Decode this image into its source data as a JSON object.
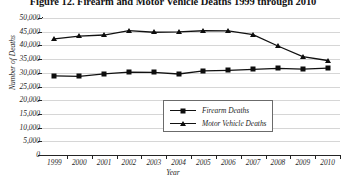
{
  "chart_data": {
    "type": "line",
    "title": "Figure 12. Firearm and Motor Vehicle Deaths 1999 through 2010",
    "xlabel": "Year",
    "ylabel": "Number of Deaths",
    "categories": [
      "1999",
      "2000",
      "2001",
      "2002",
      "2003",
      "2004",
      "2005",
      "2006",
      "2007",
      "2008",
      "2009",
      "2010"
    ],
    "ylim": [
      0,
      50000
    ],
    "ytick_labels": [
      "50,000",
      "45,000",
      "40,000",
      "35,000",
      "30,000",
      "25,000",
      "20,000",
      "15,000",
      "10,000",
      "5,000",
      "0"
    ],
    "ytick_values": [
      50000,
      45000,
      40000,
      35000,
      30000,
      25000,
      20000,
      15000,
      10000,
      5000,
      0
    ],
    "grid": true,
    "legend_position": "center-bottom-inside",
    "series": [
      {
        "name": "Firearm Deaths",
        "marker": "square",
        "values": [
          28874,
          28663,
          29573,
          30242,
          30136,
          29569,
          30694,
          30896,
          31224,
          31593,
          31347,
          31672
        ]
      },
      {
        "name": "Motor Vehicle Deaths",
        "marker": "triangle",
        "values": [
          42401,
          43354,
          43788,
          45380,
          44800,
          44933,
          45343,
          45316,
          43945,
          39790,
          35900,
          34485
        ]
      }
    ]
  },
  "legend": {
    "entries": [
      {
        "label": "Firearm Deaths"
      },
      {
        "label": "Motor Vehicle Deaths"
      }
    ]
  }
}
